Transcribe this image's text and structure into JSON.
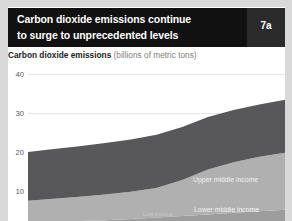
{
  "page": {
    "background": "#d9d9d9",
    "sheet_color": "#ffffff"
  },
  "header": {
    "title_line_1": "Carbon dioxide emissions continue",
    "title_line_2": "to surge to unprecedented levels",
    "badge": "7a",
    "bar_color": "#111111",
    "badge_color": "#2b2b2b",
    "text_color": "#ffffff"
  },
  "subtitle": {
    "bold": "Carbon dioxide emissions",
    "unit": "(billions of metric tons)"
  },
  "chart_data": {
    "type": "area",
    "stacked": true,
    "title": "Carbon dioxide emissions continue to surge to unprecedented levels",
    "xlabel": "",
    "ylabel": "Carbon dioxide emissions (billions of metric tons)",
    "ylim": [
      0,
      45
    ],
    "yticks": [
      40,
      30,
      20,
      10
    ],
    "grid": true,
    "legend_position": "inline-right",
    "x": [
      0,
      10,
      20,
      30,
      40,
      50,
      60,
      70,
      80,
      90,
      100
    ],
    "series": [
      {
        "name": "Low income",
        "label": "Low income",
        "color": "#8d8d8d",
        "values": [
          0.3,
          0.3,
          0.3,
          0.3,
          0.3,
          0.3,
          0.4,
          0.4,
          0.4,
          0.4,
          0.4
        ]
      },
      {
        "name": "Lower middle income",
        "label": "Lower middle income",
        "color": "#9d9d9d",
        "values": [
          1.6,
          1.8,
          2.0,
          2.2,
          2.5,
          2.9,
          3.2,
          3.6,
          4.0,
          4.4,
          4.8
        ]
      },
      {
        "name": "Upper middle income",
        "label": "Upper middle income",
        "color": "#b0b0b0",
        "values": [
          5.6,
          5.9,
          6.2,
          6.6,
          7.0,
          7.6,
          9.2,
          11.5,
          13.0,
          14.0,
          14.6
        ]
      },
      {
        "name": "High income",
        "label": "High income",
        "color": "#58585a",
        "values": [
          12.5,
          12.8,
          13.0,
          13.2,
          13.4,
          13.6,
          13.6,
          13.5,
          13.4,
          13.4,
          13.6
        ]
      }
    ],
    "totals": [
      20.0,
      20.8,
      21.5,
      22.3,
      23.2,
      24.4,
      26.4,
      29.0,
      30.8,
      32.2,
      33.4
    ]
  },
  "axis": {
    "tick_40": "40",
    "tick_30": "30",
    "tick_20": "20",
    "tick_10": "10"
  }
}
